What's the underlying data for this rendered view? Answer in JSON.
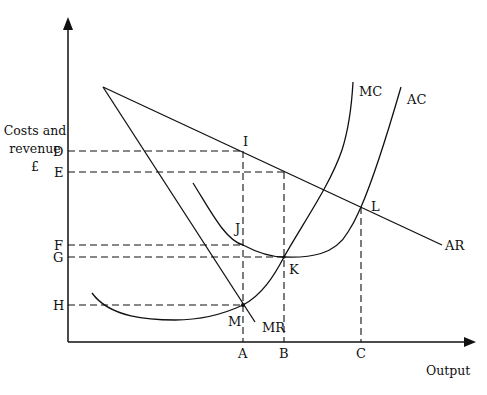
{
  "diagram": {
    "y_axis_title_line1": "Costs and",
    "y_axis_title_line2": "revenue",
    "y_axis_title_line3": "£",
    "x_axis_title": "Output",
    "curves": {
      "mc": "MC",
      "ac": "AC",
      "ar": "AR",
      "mr": "MR"
    },
    "y_levels": {
      "d": "D",
      "e": "E",
      "f": "F",
      "g": "G",
      "h": "H"
    },
    "x_levels": {
      "a": "A",
      "b": "B",
      "c": "C"
    },
    "points": {
      "i": "I",
      "j": "J",
      "k": "K",
      "l": "L",
      "m": "M"
    }
  }
}
